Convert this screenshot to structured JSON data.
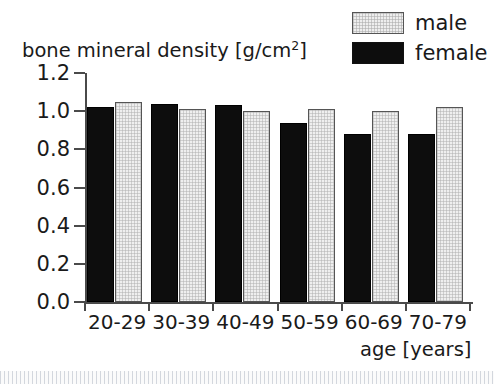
{
  "chart_data": {
    "type": "bar",
    "title": "",
    "subtitle": "",
    "ylabel": "bone mineral density [g/cm2]",
    "ylabel_base": "bone mineral density [g/cm",
    "ylabel_sup": "2",
    "ylabel_tail": "]",
    "xlabel": "age [years]",
    "categories": [
      "20-29",
      "30-39",
      "40-49",
      "50-59",
      "60-69",
      "70-79"
    ],
    "series": [
      {
        "name": "female",
        "color": "#0d0d0d",
        "values": [
          1.02,
          1.04,
          1.03,
          0.94,
          0.88,
          0.88
        ]
      },
      {
        "name": "male",
        "color": "#efefef",
        "values": [
          1.05,
          1.01,
          1.0,
          1.01,
          1.0,
          1.02
        ]
      }
    ],
    "series_order_in_plot": [
      "female",
      "male"
    ],
    "ylim": [
      0.0,
      1.2
    ],
    "ytick_values": [
      0.0,
      0.2,
      0.4,
      0.6,
      0.8,
      1.0,
      1.2
    ],
    "ytick_labels": [
      "0.0",
      "0.2",
      "0.4",
      "0.6",
      "0.8",
      "1.0",
      "1.2"
    ],
    "grid": false,
    "legend_position": "top-right",
    "legend_entries": [
      "male",
      "female"
    ]
  },
  "legend": {
    "rows": [
      {
        "label": "male",
        "swatch": "light-gray-hatched"
      },
      {
        "label": "female",
        "swatch": "solid-black"
      }
    ]
  },
  "axes": {
    "y_title_base": "bone mineral density [g/cm",
    "y_title_sup": "2",
    "y_title_tail": "]",
    "x_title": "age [years]"
  }
}
